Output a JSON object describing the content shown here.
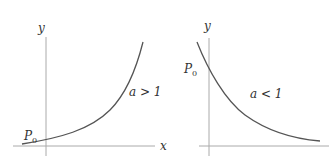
{
  "left_plot": {
    "y_label": "y",
    "x_label": "x",
    "point_label": "P",
    "point_sub": "0",
    "curve_label": "a > 1"
  },
  "right_plot": {
    "y_label": "y",
    "point_label": "P",
    "point_sub": "0",
    "curve_label": "a < 1"
  },
  "colors": {
    "axis": "#aaaaaa",
    "curve": "#555555",
    "text": "#333333"
  }
}
